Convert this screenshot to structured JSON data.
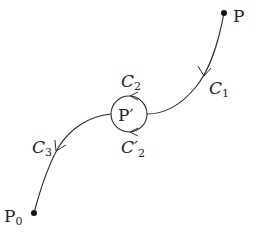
{
  "diagram": {
    "type": "contour-path",
    "points": {
      "P": {
        "label": "P",
        "x": 224,
        "y": 13
      },
      "P_prime": {
        "label": "P′",
        "x": 129,
        "y": 114
      },
      "P0": {
        "label": "P",
        "subscript": "0",
        "x": 34,
        "y": 213
      }
    },
    "curves": {
      "C1": {
        "label": "C",
        "subscript": "1"
      },
      "C2": {
        "label": "C",
        "subscript": "2"
      },
      "C2_prime": {
        "label": "C′",
        "subscript": "2"
      },
      "C3": {
        "label": "C",
        "subscript": "3"
      }
    },
    "colors": {
      "stroke": "#2a2a2a",
      "text": "#222222",
      "background": "#ffffff"
    }
  }
}
